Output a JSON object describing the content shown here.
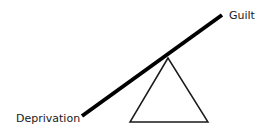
{
  "diagram": {
    "type": "seesaw-balance",
    "labels": {
      "high_end": "Guilt",
      "low_end": "Deprivation"
    },
    "beam": {
      "x1": 82,
      "y1": 116,
      "x2": 222,
      "y2": 15,
      "color": "#000000",
      "width": 4
    },
    "fulcrum": {
      "apex": [
        168,
        58
      ],
      "base_left": [
        130,
        122
      ],
      "base_right": [
        208,
        122
      ],
      "stroke": "#1a1a1a"
    }
  }
}
